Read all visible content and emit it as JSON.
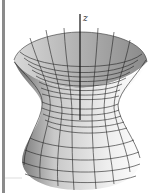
{
  "figure": {
    "title": "",
    "surface": "hyperboloid of one sheet",
    "axis_label": "z",
    "colors": {
      "mesh": "#222222",
      "surface_light": "#f2f2f2",
      "surface_dark": "#8c8c8c",
      "left_bar": "#8a8a8a"
    }
  }
}
